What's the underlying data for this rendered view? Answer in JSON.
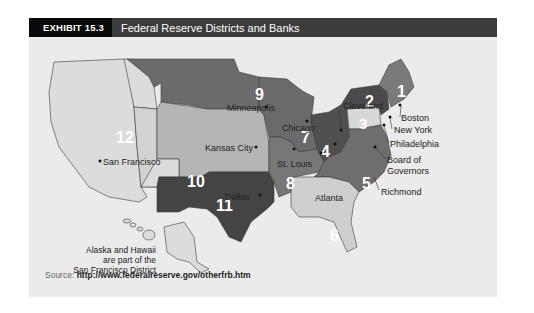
{
  "header": {
    "exhibit_label": "EXHIBIT 15.3",
    "title": "Federal Reserve Districts and Banks"
  },
  "map": {
    "districts": [
      {
        "number": "1",
        "bank": "Boston"
      },
      {
        "number": "2",
        "bank": "New York"
      },
      {
        "number": "3",
        "bank": "Philadelphia"
      },
      {
        "number": "4",
        "bank": "Cleveland"
      },
      {
        "number": "5",
        "bank": "Richmond"
      },
      {
        "number": "6",
        "bank": "Atlanta"
      },
      {
        "number": "7",
        "bank": "Chicago"
      },
      {
        "number": "8",
        "bank": "St. Louis"
      },
      {
        "number": "9",
        "bank": "Minneapolis"
      },
      {
        "number": "10",
        "bank": "Kansas City"
      },
      {
        "number": "11",
        "bank": "Dallas"
      },
      {
        "number": "12",
        "bank": "San Francisco"
      }
    ],
    "board_label_line1": "Board of",
    "board_label_line2": "Governors",
    "note_line1": "Alaska and Hawaii",
    "note_line2": "are part of the",
    "note_line3": "San Francisco District",
    "colors": {
      "d1": "#7a7a7a",
      "d2": "#4a4a4a",
      "d3": "#d8d8d8",
      "d4": "#505050",
      "d5": "#6e6e6e",
      "d6": "#cfcfcf",
      "d7": "#6a6a6a",
      "d8": "#777777",
      "d9": "#6b6b6b",
      "d10": "#b5b5b5",
      "d11": "#444444",
      "d12": "#dcdcdc"
    }
  },
  "source": {
    "label": "Source:",
    "url": "http://www.federalreserve.gov/otherfrb.htm"
  }
}
